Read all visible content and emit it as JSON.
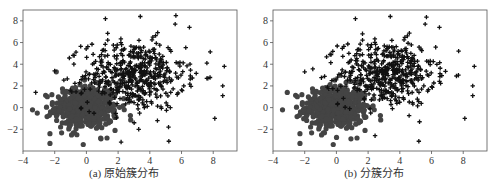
{
  "chart_data": [
    {
      "type": "scatter",
      "title": "(a) 原始簇分布",
      "xlabel": "",
      "ylabel": "",
      "xlim": [
        -4,
        9.5
      ],
      "ylim": [
        -4,
        9
      ],
      "xticks": [
        -4,
        -2,
        0,
        2,
        4,
        6,
        8
      ],
      "yticks": [
        -2,
        0,
        2,
        4,
        6,
        8
      ],
      "grid": false,
      "legend": null,
      "series": [
        {
          "name": "cluster-1 (circles)",
          "marker": "circle",
          "color": "#444444",
          "center": [
            0,
            0
          ],
          "std": [
            1.0,
            1.0
          ],
          "n": 500,
          "notable_points": [
            [
              -3.4,
              -0.2
            ],
            [
              -3.1,
              -0.5
            ],
            [
              -2.3,
              -2.4
            ],
            [
              -2.3,
              -3.3
            ],
            [
              -1.9,
              3.3
            ],
            [
              -0.2,
              -3.4
            ],
            [
              1.3,
              -2.8
            ],
            [
              0.9,
              -2.8
            ],
            [
              -0.6,
              -2.5
            ]
          ]
        },
        {
          "name": "cluster-2 (plus)",
          "marker": "plus",
          "color": "#111111",
          "center": [
            3,
            3
          ],
          "std": [
            1.6,
            1.6
          ],
          "n": 500,
          "notable_points": [
            [
              1.2,
              8.2
            ],
            [
              3.4,
              8.4
            ],
            [
              5.6,
              7.7
            ],
            [
              6.5,
              7.4
            ],
            [
              8.7,
              3.8
            ],
            [
              8.6,
              2.0
            ],
            [
              8.6,
              1.1
            ],
            [
              8.1,
              -1.0
            ],
            [
              5.2,
              -3.1
            ],
            [
              3.3,
              -2.0
            ],
            [
              7.6,
              2.7
            ],
            [
              7.6,
              4.1
            ],
            [
              -3.2,
              1.4
            ]
          ]
        }
      ]
    },
    {
      "type": "scatter",
      "title": "(b) 分簇分布",
      "xlabel": "",
      "ylabel": "",
      "xlim": [
        -4,
        9.5
      ],
      "ylim": [
        -4,
        9
      ],
      "xticks": [
        -4,
        -2,
        0,
        2,
        4,
        6,
        8
      ],
      "yticks": [
        -2,
        0,
        2,
        4,
        6,
        8
      ],
      "grid": false,
      "legend": null,
      "series": [
        {
          "name": "assigned cluster-1 (circles)",
          "marker": "circle",
          "color": "#444444",
          "center": [
            0,
            0
          ],
          "std": [
            1.0,
            1.0
          ],
          "n": 520,
          "notable_points": [
            [
              -3.4,
              -0.2
            ],
            [
              -3.1,
              1.4
            ],
            [
              -2.3,
              -2.4
            ],
            [
              -2.3,
              -3.3
            ],
            [
              -0.2,
              -3.4
            ],
            [
              1.3,
              -2.8
            ]
          ]
        },
        {
          "name": "assigned cluster-2 (plus)",
          "marker": "plus",
          "color": "#111111",
          "center": [
            3.2,
            3.2
          ],
          "std": [
            1.5,
            1.5
          ],
          "n": 480,
          "notable_points": [
            [
              1.2,
              8.2
            ],
            [
              3.4,
              8.4
            ],
            [
              5.6,
              7.7
            ],
            [
              6.5,
              7.4
            ],
            [
              8.7,
              3.8
            ],
            [
              8.6,
              2.0
            ],
            [
              8.6,
              1.1
            ],
            [
              8.1,
              -1.0
            ],
            [
              5.2,
              -3.1
            ],
            [
              -2.0,
              3.3
            ]
          ]
        }
      ]
    }
  ],
  "captions": {
    "a": "(a) 原始簇分布",
    "b": "(b) 分簇分布"
  }
}
